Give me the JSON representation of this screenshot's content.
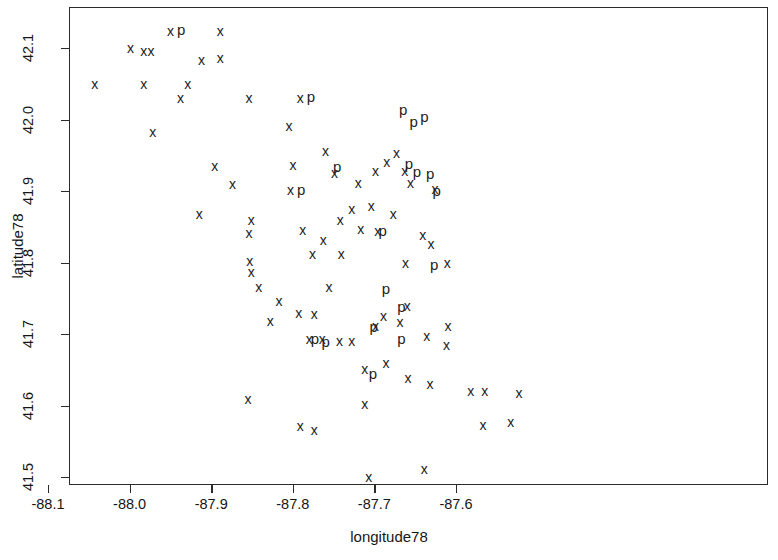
{
  "chart_data": {
    "type": "scatter",
    "title": "",
    "xlabel": "longitude78",
    "ylabel": "latitude78",
    "xlim": [
      -88.133,
      -88.133
    ],
    "ylim": [
      41.49,
      42.155
    ],
    "grid": false,
    "legend": "none",
    "x_ticks": [
      -88.1,
      -88.0,
      -87.9,
      -87.8,
      -87.7,
      -87.6
    ],
    "x_tick_labels": [
      "-88.1",
      "-88.0",
      "-87.9",
      "-87.8",
      "-87.7",
      "-87.6"
    ],
    "y_ticks": [
      41.5,
      41.6,
      41.7,
      41.8,
      41.9,
      42.0,
      42.1
    ],
    "y_tick_labels": [
      "41.5",
      "41.6",
      "41.7",
      "41.8",
      "41.9",
      "42.0",
      "42.1"
    ],
    "marker_glyphs": [
      "x",
      "p"
    ],
    "series": [
      {
        "name": "x",
        "marker": "x",
        "points": [
          [
            -88.044,
            42.051
          ],
          [
            -88.0,
            42.101
          ],
          [
            -87.984,
            42.097
          ],
          [
            -87.951,
            42.125
          ],
          [
            -87.984,
            42.051
          ],
          [
            -87.93,
            42.051
          ],
          [
            -87.973,
            41.984
          ],
          [
            -87.975,
            42.097
          ],
          [
            -87.89,
            42.088
          ],
          [
            -87.913,
            42.084
          ],
          [
            -87.89,
            42.125
          ],
          [
            -87.939,
            42.031
          ],
          [
            -87.855,
            42.031
          ],
          [
            -87.792,
            42.031
          ],
          [
            -87.806,
            41.993
          ],
          [
            -87.875,
            41.911
          ],
          [
            -87.897,
            41.936
          ],
          [
            -87.801,
            41.938
          ],
          [
            -87.804,
            41.903
          ],
          [
            -87.761,
            41.957
          ],
          [
            -87.75,
            41.927
          ],
          [
            -87.916,
            41.869
          ],
          [
            -87.852,
            41.861
          ],
          [
            -87.855,
            41.842
          ],
          [
            -87.721,
            41.912
          ],
          [
            -87.729,
            41.876
          ],
          [
            -87.789,
            41.847
          ],
          [
            -87.718,
            41.848
          ],
          [
            -87.7,
            41.93
          ],
          [
            -87.686,
            41.942
          ],
          [
            -87.674,
            41.954
          ],
          [
            -87.664,
            41.929
          ],
          [
            -87.657,
            41.913
          ],
          [
            -87.627,
            41.904
          ],
          [
            -87.632,
            41.827
          ],
          [
            -87.642,
            41.84
          ],
          [
            -87.854,
            41.803
          ],
          [
            -87.852,
            41.788
          ],
          [
            -87.777,
            41.813
          ],
          [
            -87.764,
            41.833
          ],
          [
            -87.743,
            41.861
          ],
          [
            -87.742,
            41.813
          ],
          [
            -87.697,
            41.845
          ],
          [
            -87.705,
            41.881
          ],
          [
            -87.678,
            41.869
          ],
          [
            -87.663,
            41.801
          ],
          [
            -87.612,
            41.801
          ],
          [
            -87.843,
            41.767
          ],
          [
            -87.818,
            41.747
          ],
          [
            -87.829,
            41.72
          ],
          [
            -87.794,
            41.731
          ],
          [
            -87.775,
            41.729
          ],
          [
            -87.757,
            41.767
          ],
          [
            -87.729,
            41.692
          ],
          [
            -87.69,
            41.727
          ],
          [
            -87.661,
            41.741
          ],
          [
            -87.7,
            41.713
          ],
          [
            -87.67,
            41.718
          ],
          [
            -87.637,
            41.699
          ],
          [
            -87.611,
            41.713
          ],
          [
            -87.765,
            41.695
          ],
          [
            -87.781,
            41.695
          ],
          [
            -87.744,
            41.692
          ],
          [
            -87.713,
            41.653
          ],
          [
            -87.687,
            41.661
          ],
          [
            -87.66,
            41.64
          ],
          [
            -87.856,
            41.611
          ],
          [
            -87.713,
            41.604
          ],
          [
            -87.792,
            41.573
          ],
          [
            -87.775,
            41.567
          ],
          [
            -87.613,
            41.686
          ],
          [
            -87.633,
            41.632
          ],
          [
            -87.583,
            41.622
          ],
          [
            -87.566,
            41.622
          ],
          [
            -87.524,
            41.619
          ],
          [
            -87.568,
            41.574
          ],
          [
            -87.534,
            41.578
          ],
          [
            -87.64,
            41.513
          ],
          [
            -87.708,
            41.502
          ]
        ]
      },
      {
        "name": "p",
        "marker": "p",
        "points": [
          [
            -87.938,
            42.128
          ],
          [
            -87.779,
            42.034
          ],
          [
            -87.666,
            42.016
          ],
          [
            -87.64,
            42.006
          ],
          [
            -87.653,
            41.999
          ],
          [
            -87.747,
            41.937
          ],
          [
            -87.791,
            41.904
          ],
          [
            -87.659,
            41.941
          ],
          [
            -87.649,
            41.93
          ],
          [
            -87.633,
            41.927
          ],
          [
            -87.625,
            41.903
          ],
          [
            -87.691,
            41.847
          ],
          [
            -87.628,
            41.799
          ],
          [
            -87.687,
            41.766
          ],
          [
            -87.774,
            41.696
          ],
          [
            -87.761,
            41.692
          ],
          [
            -87.702,
            41.712
          ],
          [
            -87.668,
            41.741
          ],
          [
            -87.668,
            41.696
          ],
          [
            -87.703,
            41.647
          ]
        ]
      }
    ]
  }
}
